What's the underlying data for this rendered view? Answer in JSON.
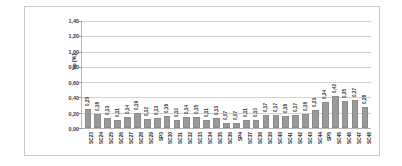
{
  "chart_data": {
    "type": "bar",
    "title": "",
    "subtitle": "",
    "xlabel": "",
    "ylabel": "Vp [%]",
    "ylim": [
      0,
      1.4
    ],
    "ytick_labels": [
      "1,40",
      "1,20",
      "1,00",
      "0,80",
      "0,60",
      "0,40",
      "0,20",
      "0,00"
    ],
    "ytick_values": [
      1.4,
      1.2,
      1.0,
      0.8,
      0.6,
      0.4,
      0.2,
      0.0
    ],
    "grid": true,
    "legend": false,
    "legend_position": "none",
    "bar_color": "#9a9a9a",
    "categories": [
      "SC23",
      "SC24",
      "SC25",
      "SC26",
      "SC27",
      "SC28",
      "SC29",
      "SP3",
      "SC30",
      "SC31",
      "SC32",
      "SC33",
      "SC34",
      "SC35",
      "SC36",
      "SP4",
      "SC37",
      "SC38",
      "SC39",
      "SC40",
      "SC41",
      "SC42",
      "SC43",
      "SC44",
      "SP5",
      "SC45",
      "SC46",
      "SC47",
      "SC48"
    ],
    "values": [
      0.25,
      0.18,
      0.13,
      0.11,
      0.14,
      0.19,
      0.12,
      0.13,
      0.16,
      0.1,
      0.14,
      0.15,
      0.11,
      0.13,
      0.07,
      0.07,
      0.11,
      0.1,
      0.17,
      0.17,
      0.16,
      0.17,
      0.18,
      0.23,
      0.34,
      0.42,
      0.35,
      0.37,
      0.28
    ],
    "value_labels": [
      "0,25",
      "0,18",
      "0,13",
      "0,11",
      "0,14",
      "0,19",
      "0,12",
      "0,13",
      "0,16",
      "0,10",
      "0,14",
      "0,15",
      "0,11",
      "0,13",
      "0,07",
      "0,07",
      "0,11",
      "0,10",
      "0,17",
      "0,17",
      "0,16",
      "0,17",
      "0,18",
      "0,23",
      "0,34",
      "0,42",
      "0,35",
      "0,37",
      "0,28"
    ]
  }
}
